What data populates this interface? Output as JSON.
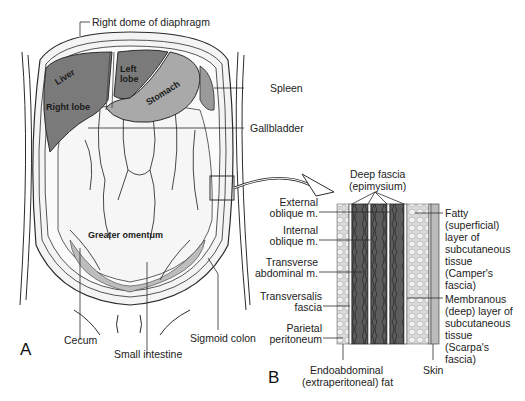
{
  "figure": {
    "panel_a": {
      "letter": "A",
      "inner_labels": {
        "liver": "Liver",
        "right_lobe": "Right lobe",
        "left_lobe_1": "Left",
        "left_lobe_2": "lobe",
        "stomach": "Stomach",
        "greater_omentum": "Greater omentum"
      },
      "callouts": {
        "diaphragm": "Right dome of diaphragm",
        "spleen": "Spleen",
        "gallbladder": "Gallbladder",
        "cecum": "Cecum",
        "small_intestine": "Small intestine",
        "sigmoid_colon": "Sigmoid colon"
      }
    },
    "panel_b": {
      "letter": "B",
      "left_labels": {
        "deep_fascia_1": "Deep fascia",
        "deep_fascia_2": "(epimysium)",
        "ext_oblique_1": "External",
        "ext_oblique_2": "oblique m.",
        "int_oblique_1": "Internal",
        "int_oblique_2": "oblique m.",
        "transverse_1": "Transverse",
        "transverse_2": "abdominal m.",
        "transversalis_1": "Transversalis",
        "transversalis_2": "fascia",
        "parietal_1": "Parietal",
        "parietal_2": "peritoneum",
        "endo_1": "Endoabdominal",
        "endo_2": "(extraperitoneal) fat"
      },
      "right_labels": {
        "fatty_1": "Fatty",
        "fatty_2": "(superficial)",
        "fatty_3": "layer of",
        "fatty_4": "subcutaneous",
        "fatty_5": "tissue",
        "fatty_6": "(Camper's",
        "fatty_7": "fascia)",
        "membranous_1": "Membranous",
        "membranous_2": "(deep) layer of",
        "membranous_3": "subcutaneous",
        "membranous_4": "tissue",
        "membranous_5": "(Scarpa's",
        "membranous_6": "fascia)",
        "skin": "Skin"
      }
    },
    "colors": {
      "liver": "#7a7a7a",
      "stomach": "#a9a9a9",
      "muscle": "#5a5a5a",
      "fat": "#e6e6e6",
      "omentum": "#f2f2f2",
      "line": "#2b2b2b"
    }
  }
}
